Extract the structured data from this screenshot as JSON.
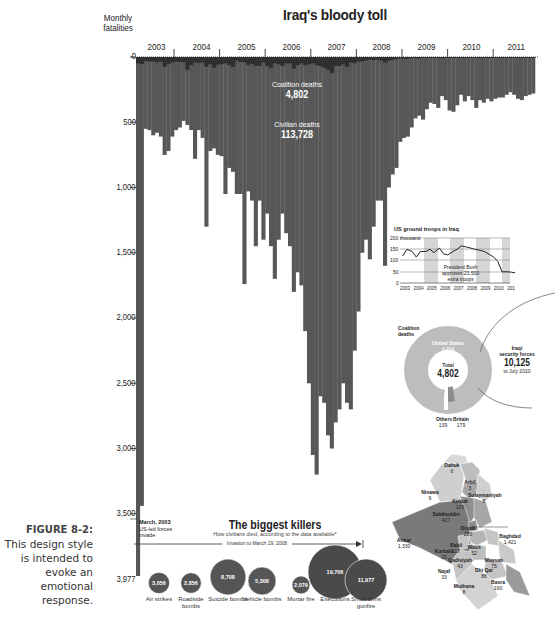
{
  "figure": {
    "number_label": "FIGURE 8-2:",
    "caption": "This design style is intended to evoke an emotional response."
  },
  "chart_data": [
    {
      "type": "bar",
      "title": "Iraq's bloody toll",
      "ylabel": "Monthly fatalities",
      "ylim": [
        0,
        3977
      ],
      "y_axis_inverted": true,
      "y_ticks": [
        "0",
        "500",
        "1,000",
        "1,500",
        "2,000",
        "2,500",
        "3,000",
        "3,500",
        "3,977"
      ],
      "x_tick_labels": [
        "2003",
        "2004",
        "2005",
        "2006",
        "2007",
        "2008",
        "2009",
        "2010",
        "2011"
      ],
      "grid": false,
      "annotations": [
        {
          "label": "Coalition deaths",
          "value": "4,802"
        },
        {
          "label": "Civilian deaths",
          "value": "113,728"
        },
        {
          "label": "March, 2003 US-led forces invade",
          "value": "3,977"
        }
      ],
      "series": [
        {
          "name": "Civilian deaths (monthly, approx.)",
          "start": "2003-03",
          "values": [
            3977,
            3440,
            550,
            560,
            600,
            580,
            610,
            750,
            720,
            610,
            560,
            540,
            490,
            520,
            560,
            780,
            560,
            620,
            1300,
            720,
            700,
            750,
            760,
            1050,
            850,
            880,
            1050,
            1050,
            1740,
            1030,
            1100,
            1450,
            1100,
            1400,
            1200,
            1450,
            1700,
            1400,
            1200,
            1350,
            1450,
            1800,
            1650,
            1750,
            2100,
            2500,
            3050,
            3200,
            2600,
            2650,
            2900,
            3000,
            2800,
            2700,
            2500,
            2650,
            2700,
            2250,
            1950,
            1500,
            1400,
            1550,
            1300,
            1100,
            1100,
            1600,
            1000,
            900,
            850,
            650,
            620,
            610,
            540,
            470,
            450,
            480,
            400,
            350,
            360,
            390,
            300,
            330,
            410,
            420,
            370,
            290,
            340,
            300,
            330,
            390,
            330,
            350,
            320,
            340,
            320,
            310,
            310,
            290,
            270,
            290,
            320,
            330,
            300,
            290,
            280
          ]
        },
        {
          "name": "Coalition deaths (monthly, approx.)",
          "start": "2003-03",
          "values": [
            70,
            80,
            40,
            50,
            50,
            60,
            50,
            110,
            80,
            60,
            50,
            55,
            60,
            145,
            90,
            60,
            65,
            60,
            110,
            80,
            120,
            85,
            80,
            70,
            90,
            110,
            40,
            55,
            60,
            90,
            75,
            100,
            100,
            60,
            100,
            120,
            70,
            80,
            100,
            70,
            70,
            130,
            90,
            70,
            90,
            80,
            70,
            90,
            100,
            120,
            140,
            180,
            100,
            100,
            80,
            110,
            60,
            70,
            50,
            50,
            40,
            30,
            35,
            30,
            40,
            60,
            40,
            30,
            20,
            15,
            20,
            20,
            15,
            15,
            15,
            10,
            10,
            10,
            10,
            10,
            15,
            10,
            10,
            10,
            10,
            10,
            10,
            10,
            10,
            10,
            10,
            10,
            5,
            5,
            5,
            5,
            5,
            5,
            5,
            5,
            5,
            5,
            5,
            5,
            5
          ]
        }
      ]
    },
    {
      "type": "line",
      "title": "US ground troops in Iraq",
      "ylabel": "thousand",
      "y_ticks": [
        "0",
        "50",
        "100",
        "150",
        "200 thousand"
      ],
      "ylim": [
        0,
        200
      ],
      "x_tick_labels": [
        "2003",
        "2004",
        "2005",
        "2006",
        "2007",
        "2008",
        "2009",
        "2010",
        "2011"
      ],
      "annotation": "President Bush approves 21,500 extra troops",
      "x": [
        2003.2,
        2003.5,
        2003.9,
        2004.2,
        2004.5,
        2004.9,
        2005.2,
        2005.5,
        2005.9,
        2006.2,
        2006.5,
        2006.9,
        2007.2,
        2007.5,
        2007.9,
        2008.2,
        2008.5,
        2008.9,
        2009.2,
        2009.5,
        2009.9,
        2010.2,
        2010.5,
        2010.9,
        2011.2,
        2011.5,
        2011.9
      ],
      "values": [
        120,
        150,
        140,
        115,
        140,
        140,
        150,
        135,
        155,
        130,
        125,
        140,
        150,
        165,
        160,
        155,
        150,
        145,
        140,
        130,
        115,
        95,
        50,
        50,
        48,
        45,
        15
      ]
    },
    {
      "type": "pie",
      "title": "Coalition deaths",
      "total_label": "Total",
      "total": "4,802",
      "labels": [
        "United States",
        "Britain",
        "Others"
      ],
      "values": [
        4484,
        179,
        139
      ],
      "value_labels": [
        "4,484",
        "179",
        "139"
      ],
      "comparison": {
        "label": "Iraqi security forces",
        "value": "10,125",
        "note": "to July 2010"
      }
    },
    {
      "type": "bubble",
      "title": "The biggest killers",
      "subtitle": "How civilians died, according to the data available*",
      "range_label": "Invasion to March 19, 2008",
      "categories": [
        "Air strikes",
        "Roadside bombs",
        "Suicide bombs",
        "Vehicle bombs",
        "Mortar fire",
        "Executions",
        "Small arms gunfire"
      ],
      "values": [
        3056,
        2856,
        8708,
        5308,
        2079,
        19706,
        11977
      ],
      "value_labels": [
        "3,056",
        "2,856",
        "8,708",
        "5,308",
        "2,079",
        "19,706",
        "11,977"
      ]
    },
    {
      "type": "map",
      "regions": [
        {
          "name": "Dahuk",
          "value": "6"
        },
        {
          "name": "Arbil",
          "value": "3"
        },
        {
          "name": "Ninawa",
          "value": "9"
        },
        {
          "name": "Sulaymaniyah",
          "value": "8"
        },
        {
          "name": "Kirkuk",
          "value": "106"
        },
        {
          "name": "Salahuddin",
          "value": "427"
        },
        {
          "name": "Diyala",
          "value": "280"
        },
        {
          "name": "Baghdad",
          "value": "1,421"
        },
        {
          "name": "Anbar",
          "value": "1,330"
        },
        {
          "name": "Babil",
          "value": "217"
        },
        {
          "name": "Wasit",
          "value": "52"
        },
        {
          "name": "Karbala",
          "value": "20"
        },
        {
          "name": "Qadisiyah",
          "value": "43"
        },
        {
          "name": "Maysan",
          "value": "75"
        },
        {
          "name": "Najaf",
          "value": "33"
        },
        {
          "name": "Dhi Qar",
          "value": "88"
        },
        {
          "name": "Basra",
          "value": "190"
        },
        {
          "name": "Muthana",
          "value": "8"
        }
      ]
    }
  ],
  "labels": {
    "title": "Iraq's bloody toll",
    "ylabel_line1": "Monthly",
    "ylabel_line2": "fatalities",
    "years": [
      "2003",
      "2004",
      "2005",
      "2006",
      "2007",
      "2008",
      "2009",
      "2010",
      "2011"
    ],
    "yticks": [
      "0",
      "500",
      "1,000",
      "1,500",
      "2,000",
      "2,500",
      "3,000",
      "3,500"
    ],
    "ymax": "3,977",
    "coalition_label": "Coalition deaths",
    "coalition_value": "4,802",
    "civilian_label": "Civilian deaths",
    "civilian_value": "113,728",
    "invasion_note_1": "March, 2003",
    "invasion_note_2": "US-led forces",
    "invasion_note_3": "invade",
    "killers_title": "The biggest killers",
    "killers_sub": "How civilians died, according to the data available*",
    "killers_range": "Invasion to March 19, 2008",
    "troops_title": "US ground troops in Iraq",
    "troops_200": "200 thousand",
    "troops_150": "150",
    "troops_100": "100",
    "troops_50": "50",
    "troops_0": "0",
    "troops_note_1": "President Bush",
    "troops_note_2": "approves 21,500",
    "troops_note_3": "extra troops",
    "troops_years": [
      "2003",
      "2004",
      "2005",
      "2006",
      "2007",
      "2008",
      "2009",
      "2010",
      "2011"
    ],
    "pie_title_1": "Coalition",
    "pie_title_2": "deaths",
    "pie_us_label": "United States",
    "pie_us_value": "4,484",
    "pie_total_label": "Total",
    "pie_total_value": "4,802",
    "pie_others_label": "Others",
    "pie_others_value": "139",
    "pie_britain_label": "Britain",
    "pie_britain_value": "179",
    "isf_1": "Iraqi",
    "isf_2": "security forces",
    "isf_value": "10,125",
    "isf_note": "to July 2010"
  },
  "colors": {
    "bar_dark": "#575757",
    "bar_darker": "#333333",
    "pie_light": "#bdbdbd",
    "pie_dark": "#8c8c8c",
    "map_anbar": "#7a7a7a",
    "map_mid": "#a6a6a6",
    "map_light": "#cfcfcf",
    "text": "#222222"
  }
}
